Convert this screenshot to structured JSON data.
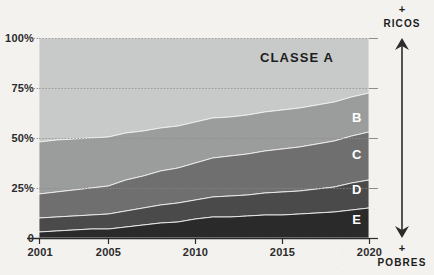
{
  "figure": {
    "title_overlay": "CLASSE A",
    "background_color": "#f3f2ef",
    "right_axis": {
      "top_plus": "+",
      "top_label": "RICOS",
      "bottom_plus": "+",
      "bottom_label": "POBRES"
    }
  },
  "chart_data": {
    "type": "area",
    "stacked": true,
    "normalized_percent": true,
    "title": "CLASSE A",
    "xlabel": "",
    "ylabel": "",
    "ylim": [
      0,
      100
    ],
    "xlim": [
      2001,
      2020
    ],
    "grid": true,
    "legend_position": "inline-right",
    "y_ticks": [
      "0",
      "25%",
      "50%",
      "75%",
      "100%"
    ],
    "y_tick_values": [
      0,
      25,
      50,
      75,
      100
    ],
    "x_ticks": [
      "2001",
      "2005",
      "2010",
      "2015",
      "2020"
    ],
    "x_tick_values": [
      2001,
      2005,
      2010,
      2015,
      2020
    ],
    "x": [
      2001,
      2002,
      2003,
      2004,
      2005,
      2006,
      2007,
      2008,
      2009,
      2010,
      2011,
      2012,
      2013,
      2014,
      2015,
      2016,
      2017,
      2018,
      2019,
      2020
    ],
    "series": [
      {
        "name": "E",
        "label": "E",
        "color": "#2a2a2a",
        "values": [
          3.0,
          3.5,
          4.0,
          4.5,
          4.5,
          5.5,
          6.5,
          7.5,
          8.0,
          9.5,
          10.5,
          10.5,
          11.0,
          11.5,
          11.5,
          12.0,
          12.5,
          13.0,
          14.0,
          15.0
        ]
      },
      {
        "name": "D",
        "label": "D",
        "color": "#4a4a4a",
        "values": [
          7.0,
          7.0,
          7.0,
          7.0,
          7.5,
          8.0,
          8.5,
          9.0,
          9.5,
          9.5,
          10.0,
          10.5,
          10.5,
          11.0,
          11.5,
          11.5,
          12.0,
          12.5,
          13.5,
          14.0
        ]
      },
      {
        "name": "C",
        "label": "C",
        "color": "#6f6f6f",
        "values": [
          12.0,
          12.5,
          13.0,
          13.5,
          14.0,
          15.5,
          16.0,
          17.0,
          17.5,
          18.5,
          19.5,
          20.0,
          20.5,
          21.0,
          21.5,
          22.0,
          22.5,
          23.0,
          23.5,
          24.0
        ]
      },
      {
        "name": "B",
        "label": "B",
        "color": "#9a9d9c",
        "values": [
          26.0,
          26.0,
          25.5,
          25.0,
          24.5,
          23.5,
          22.5,
          21.5,
          21.0,
          20.5,
          20.0,
          19.5,
          19.5,
          19.5,
          19.5,
          19.5,
          19.5,
          19.5,
          19.5,
          19.5
        ]
      },
      {
        "name": "A",
        "label": "CLASSE A",
        "color": "#c7cac9",
        "values": [
          52.0,
          51.0,
          50.5,
          50.0,
          49.5,
          47.5,
          46.5,
          45.0,
          44.0,
          42.0,
          40.0,
          39.5,
          38.5,
          37.0,
          36.0,
          35.0,
          33.5,
          32.0,
          29.5,
          27.5
        ]
      }
    ],
    "cumulative_upper_bounds": {
      "E": [
        3.0,
        3.5,
        4.0,
        4.5,
        4.5,
        5.5,
        6.5,
        7.5,
        8.0,
        9.5,
        10.5,
        10.5,
        11.0,
        11.5,
        11.5,
        12.0,
        12.5,
        13.0,
        14.0,
        15.0
      ],
      "D": [
        10.0,
        10.5,
        11.0,
        11.5,
        12.0,
        13.5,
        15.0,
        16.5,
        17.5,
        19.0,
        20.5,
        21.0,
        21.5,
        22.5,
        23.0,
        23.5,
        24.5,
        25.5,
        27.5,
        29.0
      ],
      "C": [
        22.0,
        23.0,
        24.0,
        25.0,
        26.0,
        29.0,
        31.0,
        33.5,
        35.0,
        37.5,
        40.0,
        41.0,
        42.0,
        43.5,
        44.5,
        45.5,
        47.0,
        48.5,
        51.0,
        53.0
      ],
      "B": [
        48.0,
        49.0,
        49.5,
        50.0,
        50.5,
        52.5,
        53.5,
        55.0,
        56.0,
        58.0,
        60.0,
        60.5,
        61.5,
        63.0,
        64.0,
        65.0,
        66.5,
        68.0,
        70.5,
        72.5
      ],
      "A": [
        100,
        100,
        100,
        100,
        100,
        100,
        100,
        100,
        100,
        100,
        100,
        100,
        100,
        100,
        100,
        100,
        100,
        100,
        100,
        100
      ]
    }
  }
}
